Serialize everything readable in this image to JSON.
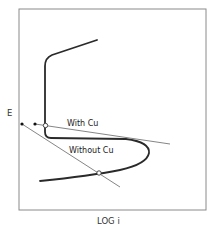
{
  "diagram": {
    "type": "polarization-diagram",
    "axes": {
      "y_label": "E",
      "x_label": "LOG i"
    },
    "labels": {
      "with_cu": "With Cu",
      "without_cu": "Without Cu"
    },
    "colors": {
      "frame": "#8a8a8a",
      "curve": "#2a2a2a",
      "line": "#777777",
      "text": "#222222"
    },
    "elements": {
      "anodic_curve": "Active-passive polarization curve",
      "cathodic_line_with_cu": "Cathodic line with Cu (intersects passive region)",
      "cathodic_line_without_cu": "Cathodic line without Cu (intersects active region)"
    }
  }
}
